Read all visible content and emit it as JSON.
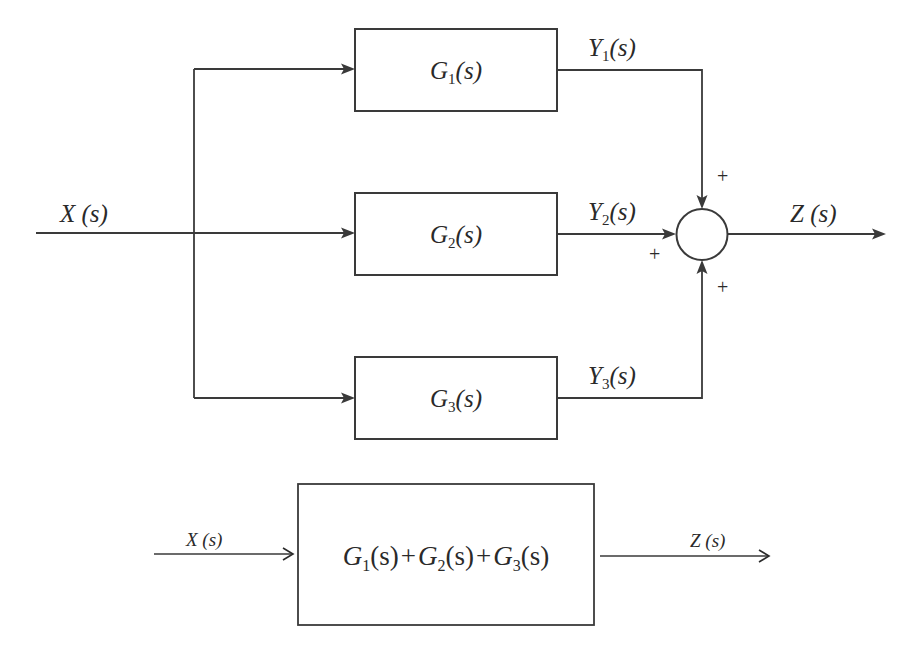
{
  "parallel_diagram": {
    "input_label": "X (s)",
    "output_label": "Z (s)",
    "blocks": [
      {
        "name": "G",
        "sub": "1",
        "arg": "(s)",
        "output": {
          "name": "Y",
          "sub": "1",
          "arg": "(s)"
        }
      },
      {
        "name": "G",
        "sub": "2",
        "arg": "(s)",
        "output": {
          "name": "Y",
          "sub": "2",
          "arg": "(s)"
        }
      },
      {
        "name": "G",
        "sub": "3",
        "arg": "(s)",
        "output": {
          "name": "Y",
          "sub": "3",
          "arg": "(s)"
        }
      }
    ],
    "summing_junction": {
      "signs": [
        "+",
        "+",
        "+"
      ]
    }
  },
  "equivalent_diagram": {
    "input_label": "X (s)",
    "output_label": "Z (s)",
    "terms": [
      {
        "name": "G",
        "sub": "1",
        "arg": "(s)"
      },
      {
        "name": "G",
        "sub": "2",
        "arg": "(s)"
      },
      {
        "name": "G",
        "sub": "3",
        "arg": "(s)"
      }
    ],
    "operator": "+"
  }
}
